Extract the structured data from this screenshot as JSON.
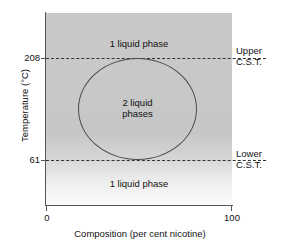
{
  "chart_data": {
    "type": "line",
    "title": "",
    "xlabel": "Composition (per cent nicotine)",
    "ylabel": "Temperature (°C)",
    "xlim": [
      0,
      100
    ],
    "ylim": [
      0,
      260
    ],
    "grid": false,
    "legend": "none",
    "x_ticks": [
      "0",
      "100"
    ],
    "y_ticks": [
      "208",
      "61"
    ],
    "annotations": [
      {
        "name": "upper-cst-line",
        "text": "Upper C.S.T.",
        "value": 208,
        "style": "dashed-horizontal-line"
      },
      {
        "name": "lower-cst-line",
        "text": "Lower C.S.T.",
        "value": 61,
        "style": "dashed-horizontal-line"
      },
      {
        "name": "upper-one-phase-region",
        "text": "1 liquid phase"
      },
      {
        "name": "two-phase-region",
        "text": "2 liquid phases"
      },
      {
        "name": "lower-one-phase-region",
        "text": "1 liquid phase"
      }
    ],
    "series": [
      {
        "name": "miscibility-loop",
        "description": "Closed solubility loop bounding the two-liquid-phase region",
        "x_range": [
          17,
          81
        ],
        "y_range": [
          61,
          208
        ]
      }
    ]
  },
  "axes": {
    "y_title": "Temperature (°C)",
    "x_title": "Composition (per cent nicotine)",
    "y_tick_upper": "208",
    "y_tick_lower": "61",
    "x_tick_left": "0",
    "x_tick_right": "100"
  },
  "regions": {
    "top_phase": "1 liquid phase",
    "two_phase_line1": "2 liquid",
    "two_phase_line2": "phases",
    "bottom_phase": "1 liquid phase"
  },
  "cst": {
    "upper_line1": "Upper",
    "upper_line2": "C.S.T.",
    "lower_line1": "Lower",
    "lower_line2": "C.S.T."
  },
  "colors": {
    "plot_top": "#c9c9c9",
    "plot_bottom": "#fbfbfb",
    "axis": "#555555",
    "curve": "#4a4a4a",
    "dashed": "#333333",
    "text": "#111111"
  }
}
